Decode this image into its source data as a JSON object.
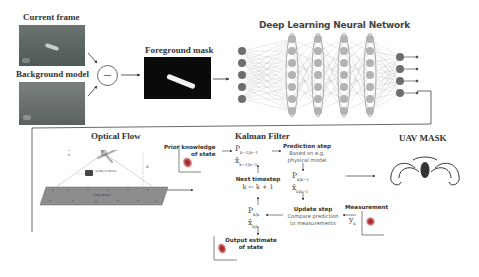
{
  "pipeline": {
    "current_frame_label": "Current frame",
    "background_model_label": "Background model",
    "subtract_symbol": "—",
    "foreground_mask_label": "Foreground mask",
    "dnn_title": "Deep Learning Neural Network",
    "dnn_layers": [
      5,
      7,
      7,
      7,
      7,
      4
    ]
  },
  "lower": {
    "optical_flow_title": "Optical Flow",
    "optical_flow_labels": {
      "velocity": "v",
      "height": "d",
      "object_motion": "(b)Object Motion",
      "ego_motion": "(f)Ego Motion"
    },
    "kalman_title": "Kalman Filter",
    "uav_mask_title": "UAV MASK",
    "kalman": {
      "prior": {
        "line1": "Prior knowledge",
        "line2": "of state"
      },
      "prior_state": {
        "P": "P",
        "P_sub": "k−1|k−1",
        "x": "x̂",
        "x_sub": "k−1|k−1"
      },
      "prediction": {
        "title": "Prediction step",
        "line1": "Based on e.g.",
        "line2": "physical model"
      },
      "predicted_state": {
        "P": "P",
        "P_sub": "k|k−1",
        "x": "x̂",
        "x_sub": "k|k−1"
      },
      "next": {
        "title": "Next timestep",
        "formula": "k ← k + 1"
      },
      "update": {
        "title": "Update step",
        "line1": "Compare prediction",
        "line2": "to measurements"
      },
      "updated_state": {
        "P": "P",
        "P_sub": "k|k",
        "x": "x̂",
        "x_sub": "k|k"
      },
      "measurement": {
        "title": "Measurement",
        "y": "y",
        "y_sub": "k"
      },
      "output": {
        "line1": "Output estimate",
        "line2": "of state"
      }
    }
  }
}
